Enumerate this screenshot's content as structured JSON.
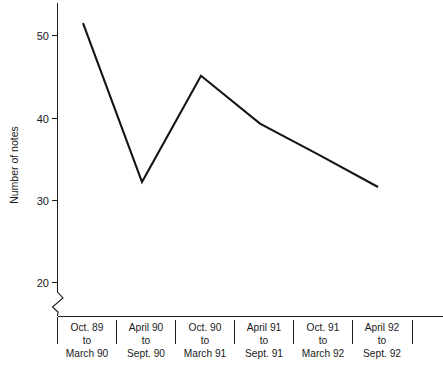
{
  "chart_data": {
    "type": "line",
    "title": "",
    "xlabel": "",
    "ylabel": "Number of notes",
    "categories": [
      "Oct. 89\nto\nMarch 90",
      "April 90\nto\nSept. 90",
      "Oct. 90\nto\nMarch 91",
      "April 91\nto\nSept. 91",
      "Oct. 91\nto\nMarch 92",
      "April 92\nto\nSept. 92"
    ],
    "category_lines": [
      [
        "Oct. 89",
        "to",
        "March 90"
      ],
      [
        "April 90",
        "to",
        "Sept. 90"
      ],
      [
        "Oct. 90",
        "to",
        "March 91"
      ],
      [
        "April 91",
        "to",
        "Sept. 91"
      ],
      [
        "Oct. 91",
        "to",
        "March 92"
      ],
      [
        "April 92",
        "to",
        "Sept. 92"
      ]
    ],
    "values": [
      51.5,
      32.2,
      45.1,
      39.3,
      35.5,
      31.6
    ],
    "ylim": [
      20,
      53
    ],
    "ytick_labels": [
      "20",
      "30",
      "40",
      "50"
    ],
    "ytick_values": [
      20,
      30,
      40,
      50
    ],
    "grid": false,
    "legend": null,
    "axis_break": true,
    "axis_break_note": "zigzag break on y-axis below 20",
    "line_color": "#141414",
    "axis_color": "#1a1a1a",
    "background_color": "#ffffff"
  },
  "axes": {
    "y_title": "Number of notes"
  }
}
